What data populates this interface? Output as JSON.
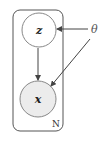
{
  "diagram": {
    "type": "plate-notation",
    "plate": {
      "label": "N",
      "x": 13,
      "y": 10,
      "width": 50,
      "height": 121,
      "radius": 7,
      "stroke": "#555555"
    },
    "nodes": [
      {
        "id": "z",
        "label": "z",
        "cx": 39,
        "cy": 30,
        "r": 17,
        "observed": false,
        "fill": "#ffffff",
        "stroke": "#888888"
      },
      {
        "id": "x",
        "label": "x",
        "cx": 38,
        "cy": 99,
        "r": 18,
        "observed": true,
        "fill": "#ececec",
        "stroke": "#888888"
      }
    ],
    "parameters": [
      {
        "id": "theta",
        "label": "θ",
        "x": 94,
        "y": 33
      }
    ],
    "edges": [
      {
        "from": "z",
        "to": "x"
      },
      {
        "from": "theta",
        "to": "z"
      },
      {
        "from": "theta",
        "to": "x"
      }
    ]
  }
}
